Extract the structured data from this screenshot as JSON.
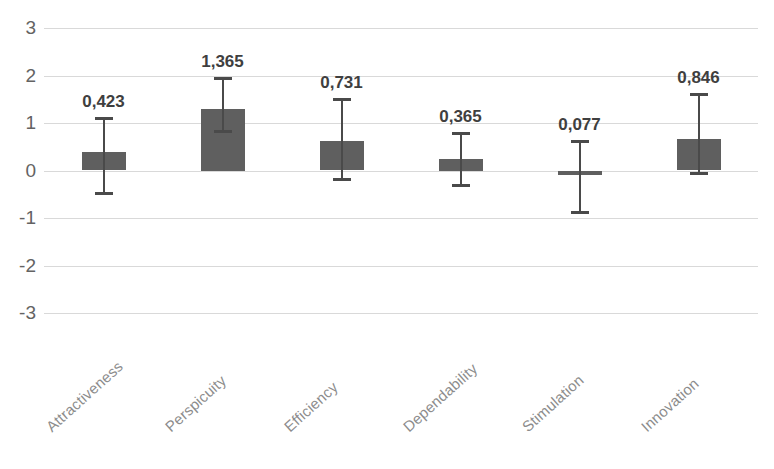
{
  "chart_data": {
    "type": "bar",
    "title": "",
    "subtitle": "",
    "xlabel": "",
    "ylabel": "",
    "ylim": [
      -3,
      3
    ],
    "yticks": [
      3,
      2,
      1,
      0,
      -1,
      -2,
      -3
    ],
    "ytick_labels": [
      "3",
      "2",
      "1",
      "0",
      "-1",
      "-2",
      "-3"
    ],
    "grid": true,
    "legend": "none",
    "decimal_separator": ",",
    "categories": [
      "Attractiveness",
      "Perspicuity",
      "Efficiency",
      "Dependability",
      "Stimulation",
      "Innovation"
    ],
    "data_labels": [
      "0,423",
      "1,365",
      "0,731",
      "0,365",
      "0,077",
      "0,846"
    ],
    "values": [
      0.423,
      1.365,
      0.731,
      0.365,
      0.077,
      0.846
    ],
    "bar_heights": [
      0.38,
      1.3,
      0.63,
      0.25,
      -0.08,
      0.66
    ],
    "error_bars": {
      "upper": [
        1.1,
        1.95,
        1.5,
        0.8,
        0.62,
        1.62
      ],
      "lower": [
        -0.47,
        0.83,
        -0.17,
        -0.31,
        -0.87,
        -0.06
      ]
    },
    "series": [
      {
        "name": "UEQ Scale Mean",
        "values": [
          0.423,
          1.365,
          0.731,
          0.365,
          0.077,
          0.846
        ]
      }
    ],
    "colors": {
      "bar_fill": "#5f5f5f",
      "error_bar": "#4a4a4a",
      "gridline": "#d9d9d9",
      "tick_text": "#636363",
      "category_text": "#8c8c8c",
      "value_text": "#3f3f3f",
      "background": "#ffffff"
    }
  }
}
